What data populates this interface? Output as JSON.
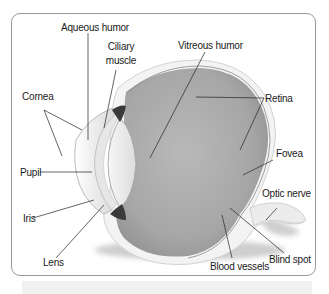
{
  "diagram": {
    "title": "",
    "colors": {
      "frame_border": "#9a9a9a",
      "vitreous_fill": "#a8a8a8",
      "sclera_fill": "#f2f2f2",
      "leader_line": "#222222",
      "text": "#1a1a1a"
    },
    "labels": {
      "aqueous_humor": "Aqueous humor",
      "ciliary_muscle_line1": "Ciliary",
      "ciliary_muscle_line2": "muscle",
      "vitreous_humor": "Vitreous humor",
      "cornea": "Cornea",
      "retina": "Retina",
      "fovea": "Fovea",
      "pupil": "Pupil",
      "optic_nerve": "Optic nerve",
      "iris": "Iris",
      "lens": "Lens",
      "blood_vessels": "Blood vessels",
      "blind_spot": "Blind spot"
    }
  }
}
